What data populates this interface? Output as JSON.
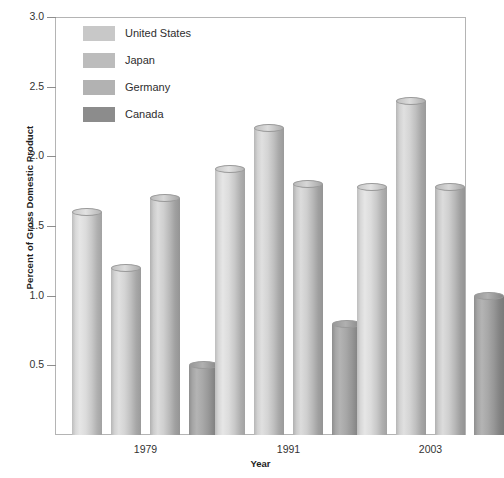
{
  "chart_data": {
    "type": "bar",
    "title": "",
    "xlabel": "Year",
    "ylabel": "Percent of Gross Domestic Product",
    "categories": [
      "1979",
      "1991",
      "2003"
    ],
    "series": [
      {
        "name": "United States",
        "color": "#c8c8c8",
        "values": [
          1.6,
          1.91,
          1.78
        ]
      },
      {
        "name": "Japan",
        "color": "#bcbcbc",
        "values": [
          1.2,
          2.2,
          2.4
        ]
      },
      {
        "name": "Germany",
        "color": "#b2b2b2",
        "values": [
          1.7,
          1.8,
          1.78
        ]
      },
      {
        "name": "Canada",
        "color": "#8c8c8c",
        "values": [
          0.5,
          0.8,
          1.0
        ]
      }
    ],
    "ylim": [
      0,
      3.0
    ],
    "yticks": [
      "0.5",
      "1.0",
      "1.5",
      "2.0",
      "2.5",
      "3.0"
    ],
    "ytick_values": [
      0.5,
      1.0,
      1.5,
      2.0,
      2.5,
      3.0
    ],
    "grid": false,
    "legend_position": "top-left-inside",
    "bar_style": "3d-cylinder"
  },
  "legend": {
    "entries": [
      {
        "label": "United States"
      },
      {
        "label": "Japan"
      },
      {
        "label": "Germany"
      },
      {
        "label": "Canada"
      }
    ]
  }
}
